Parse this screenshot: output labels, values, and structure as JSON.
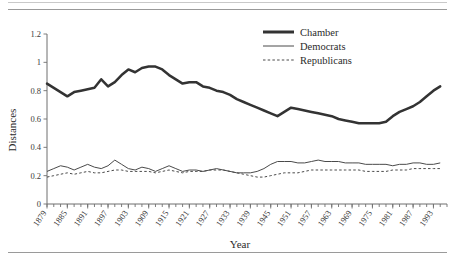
{
  "figure": {
    "ylabel": "Distances",
    "xlabel": "Year",
    "legend": [
      {
        "label": "Chamber",
        "style": "thick-solid",
        "color": "#333333"
      },
      {
        "label": "Democrats",
        "style": "thin-solid",
        "color": "#4a4a4a"
      },
      {
        "label": "Republicans",
        "style": "dashed",
        "color": "#4a4a4a"
      }
    ],
    "legend_items": {
      "chamber": "Chamber",
      "democrats": "Democrats",
      "republicans": "Republicans"
    }
  },
  "chart_data": {
    "type": "line",
    "title": "",
    "xlabel": "Year",
    "ylabel": "Distances",
    "xlim": [
      1879,
      1997
    ],
    "ylim": [
      0,
      1.2
    ],
    "yticks": [
      0,
      0.2,
      0.4,
      0.6,
      0.8,
      1,
      1.2
    ],
    "ytick_labels": [
      "0",
      "0.2",
      "0.4",
      "0.6",
      "0.8",
      "1",
      "1.2"
    ],
    "xticks": [
      1879,
      1885,
      1891,
      1897,
      1903,
      1909,
      1915,
      1921,
      1927,
      1933,
      1939,
      1945,
      1951,
      1957,
      1963,
      1969,
      1975,
      1981,
      1987,
      1993
    ],
    "xtick_labels": [
      "1879",
      "1885",
      "1891",
      "1897",
      "1903",
      "1909",
      "1915",
      "1921",
      "1927",
      "1933",
      "1939",
      "1945",
      "1951",
      "1957",
      "1963",
      "1969",
      "1975",
      "1981",
      "1987",
      "1993"
    ],
    "minor_tick_interval": 2,
    "grid": false,
    "legend_position": "top-right",
    "x": [
      1879,
      1881,
      1883,
      1885,
      1887,
      1889,
      1891,
      1893,
      1895,
      1897,
      1899,
      1901,
      1903,
      1905,
      1907,
      1909,
      1911,
      1913,
      1915,
      1917,
      1919,
      1921,
      1923,
      1925,
      1927,
      1929,
      1931,
      1933,
      1935,
      1937,
      1939,
      1941,
      1943,
      1945,
      1947,
      1949,
      1951,
      1953,
      1955,
      1957,
      1959,
      1961,
      1963,
      1965,
      1967,
      1969,
      1971,
      1973,
      1975,
      1977,
      1979,
      1981,
      1983,
      1985,
      1987,
      1989,
      1991,
      1993,
      1995
    ],
    "series": [
      {
        "name": "Chamber",
        "values": [
          0.85,
          0.82,
          0.79,
          0.76,
          0.79,
          0.8,
          0.81,
          0.82,
          0.88,
          0.83,
          0.86,
          0.91,
          0.95,
          0.93,
          0.96,
          0.97,
          0.97,
          0.95,
          0.91,
          0.88,
          0.85,
          0.86,
          0.86,
          0.83,
          0.82,
          0.8,
          0.79,
          0.77,
          0.74,
          0.72,
          0.7,
          0.68,
          0.66,
          0.64,
          0.62,
          0.65,
          0.68,
          0.67,
          0.66,
          0.65,
          0.64,
          0.63,
          0.62,
          0.6,
          0.59,
          0.58,
          0.57,
          0.57,
          0.57,
          0.57,
          0.58,
          0.62,
          0.65,
          0.67,
          0.69,
          0.72,
          0.76,
          0.8,
          0.83
        ]
      },
      {
        "name": "Democrats",
        "values": [
          0.23,
          0.25,
          0.27,
          0.26,
          0.24,
          0.26,
          0.28,
          0.26,
          0.25,
          0.27,
          0.31,
          0.28,
          0.25,
          0.24,
          0.26,
          0.25,
          0.23,
          0.25,
          0.27,
          0.25,
          0.23,
          0.24,
          0.24,
          0.23,
          0.24,
          0.25,
          0.24,
          0.23,
          0.22,
          0.22,
          0.22,
          0.23,
          0.25,
          0.28,
          0.3,
          0.3,
          0.3,
          0.29,
          0.29,
          0.3,
          0.31,
          0.3,
          0.3,
          0.3,
          0.29,
          0.29,
          0.29,
          0.28,
          0.28,
          0.28,
          0.28,
          0.27,
          0.28,
          0.28,
          0.29,
          0.29,
          0.28,
          0.28,
          0.29
        ]
      },
      {
        "name": "Republicans",
        "values": [
          0.19,
          0.2,
          0.21,
          0.22,
          0.21,
          0.22,
          0.23,
          0.22,
          0.22,
          0.23,
          0.24,
          0.24,
          0.23,
          0.23,
          0.23,
          0.23,
          0.22,
          0.23,
          0.24,
          0.23,
          0.22,
          0.23,
          0.23,
          0.23,
          0.24,
          0.24,
          0.24,
          0.23,
          0.22,
          0.21,
          0.2,
          0.19,
          0.19,
          0.2,
          0.21,
          0.22,
          0.22,
          0.22,
          0.23,
          0.24,
          0.24,
          0.24,
          0.24,
          0.24,
          0.24,
          0.24,
          0.24,
          0.23,
          0.23,
          0.23,
          0.23,
          0.24,
          0.24,
          0.24,
          0.25,
          0.25,
          0.25,
          0.25,
          0.25
        ]
      }
    ]
  }
}
